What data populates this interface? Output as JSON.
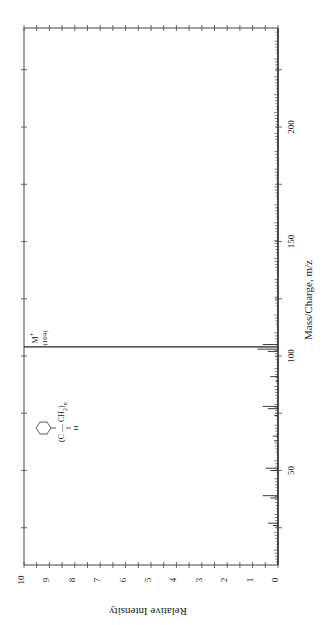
{
  "chart_data": {
    "type": "bar",
    "orientation": "rotated-90-clockwise",
    "title": "",
    "xlabel": "Mass/Charge, m/z",
    "ylabel": "Relative Intensity",
    "xlim": [
      9,
      243
    ],
    "ylim": [
      0,
      10
    ],
    "x_ticks": [
      50,
      100,
      150,
      200
    ],
    "x_tick_labels": [
      "50",
      "100",
      "150",
      "200"
    ],
    "y_ticks": [
      0,
      1,
      2,
      3,
      4,
      5,
      6,
      7,
      8,
      9,
      10
    ],
    "y_tick_labels": [
      "0",
      "1",
      "2",
      "3",
      "4",
      "5",
      "6",
      "7",
      "8",
      "9",
      "10"
    ],
    "grid": false,
    "legend": null,
    "annotations": [
      {
        "text": "M+",
        "sub": "(104)",
        "x": 104
      },
      {
        "text": "structure",
        "label": "polystyrene repeat unit: -(CH(C6H5)-CH2)n-"
      }
    ],
    "series": [
      {
        "name": "Spectrum",
        "x": [
          26,
          27,
          38,
          39,
          50,
          51,
          63,
          65,
          74,
          77,
          78,
          89,
          91,
          102,
          103,
          104,
          105
        ],
        "values": [
          0.2,
          0.4,
          0.3,
          0.6,
          0.3,
          0.5,
          0.15,
          0.2,
          0.15,
          0.4,
          0.6,
          0.1,
          0.3,
          0.4,
          0.8,
          10,
          0.6
        ]
      }
    ]
  },
  "labels": {
    "x_axis": "Mass/Charge, m/z",
    "y_axis": "Relative Intensity",
    "molecular_ion": "M",
    "molecular_ion_charge": "+",
    "molecular_ion_mass": "(104)",
    "structure_chain": "C — CH",
    "structure_sub2": "2",
    "structure_n": "n",
    "structure_h": "H"
  }
}
